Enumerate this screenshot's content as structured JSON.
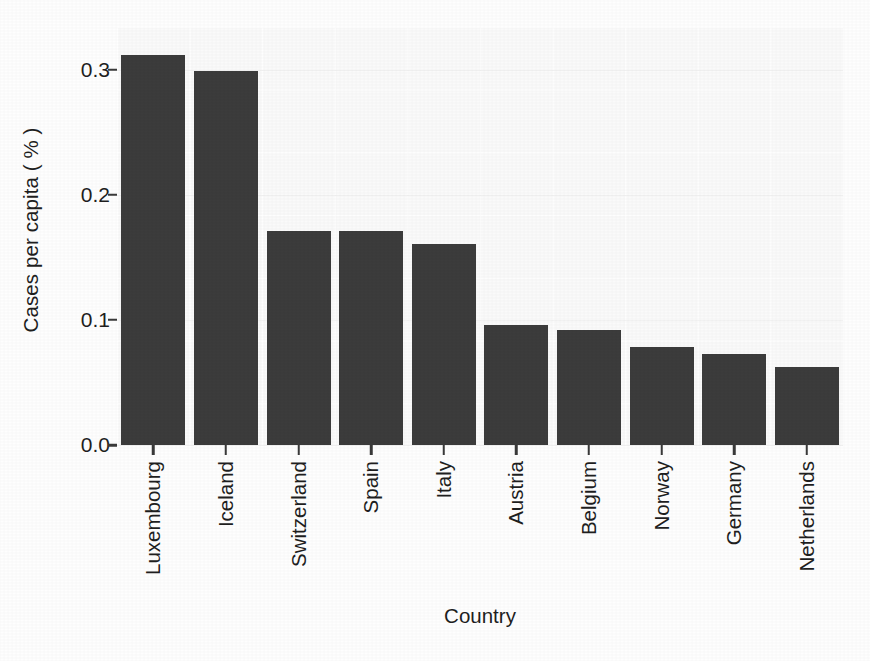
{
  "chart_data": {
    "type": "bar",
    "title": "",
    "subtitle": "",
    "xlabel": "Country",
    "ylabel": "Cases per capita ( % )",
    "categories": [
      "Luxembourg",
      "Iceland",
      "Switzerland",
      "Spain",
      "Italy",
      "Austria",
      "Belgium",
      "Norway",
      "Germany",
      "Netherlands"
    ],
    "values": [
      0.312,
      0.299,
      0.171,
      0.171,
      0.161,
      0.096,
      0.092,
      0.078,
      0.073,
      0.062
    ],
    "series": [
      {
        "name": "Cases per capita",
        "values": [
          0.312,
          0.299,
          0.171,
          0.171,
          0.161,
          0.096,
          0.092,
          0.078,
          0.073,
          0.062
        ]
      }
    ],
    "ylim": [
      0.0,
      0.334
    ],
    "xlim": [
      0,
      10
    ],
    "y_ticks": [
      0.0,
      0.1,
      0.2,
      0.3
    ],
    "y_tick_labels": [
      "0.0",
      "0.1",
      "0.2",
      "0.3"
    ],
    "x_tick_labels": [
      "Luxembourg",
      "Iceland",
      "Switzerland",
      "Spain",
      "Italy",
      "Austria",
      "Belgium",
      "Norway",
      "Germany",
      "Netherlands"
    ],
    "grid": true,
    "legend": false,
    "legend_position": "none",
    "bar_color": "#3c3c3c",
    "panel_background": "#fafafa",
    "x_tick_label_rotation": -90,
    "annotations": []
  },
  "axes": {
    "y_title": "Cases per capita ( % )",
    "x_title": "Country",
    "y_ticks": [
      {
        "label": "0.3",
        "value": 0.3
      },
      {
        "label": "0.2",
        "value": 0.2
      },
      {
        "label": "0.1",
        "value": 0.1
      },
      {
        "label": "0.0",
        "value": 0.0
      }
    ]
  }
}
